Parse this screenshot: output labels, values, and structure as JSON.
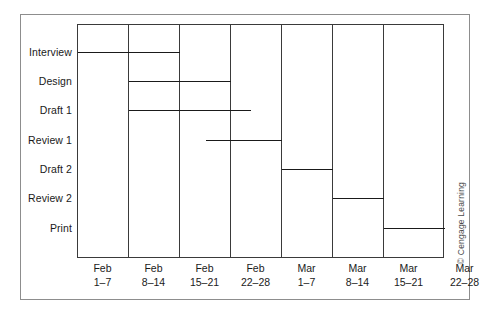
{
  "chart_data": {
    "type": "bar",
    "title": "",
    "subtitle": "",
    "xlabel": "",
    "ylabel": "",
    "orientation": "horizontal-gantt",
    "grid": true,
    "legend": null,
    "x_unit": "week",
    "x_ticks": [
      {
        "month": "Feb",
        "days": "1–7"
      },
      {
        "month": "Feb",
        "days": "8–14"
      },
      {
        "month": "Feb",
        "days": "15–21"
      },
      {
        "month": "Feb",
        "days": "22–28"
      },
      {
        "month": "Mar",
        "days": "1–7"
      },
      {
        "month": "Mar",
        "days": "8–14"
      },
      {
        "month": "Mar",
        "days": "15–21"
      },
      {
        "month": "Mar",
        "days": "22–28"
      }
    ],
    "categories": [
      "Interview",
      "Design",
      "Draft 1",
      "Review 1",
      "Draft 2",
      "Review 2",
      "Print"
    ],
    "xlim": [
      0,
      8
    ],
    "tasks": [
      {
        "name": "Interview",
        "start_week": 0.0,
        "end_week": 2.0,
        "start_label": "Feb 1–7",
        "end_label": "Feb 15–21"
      },
      {
        "name": "Design",
        "start_week": 1.0,
        "end_week": 3.0,
        "start_label": "Feb 8–14",
        "end_label": "Feb 22–28"
      },
      {
        "name": "Draft 1",
        "start_week": 1.0,
        "end_week": 3.4,
        "start_label": "Feb 8–14",
        "end_label": "Feb 22–28"
      },
      {
        "name": "Review 1",
        "start_week": 2.5,
        "end_week": 4.0,
        "start_label": "Feb 15–21",
        "end_label": "Mar 1–7"
      },
      {
        "name": "Draft 2",
        "start_week": 4.0,
        "end_week": 5.0,
        "start_label": "Mar 1–7",
        "end_label": "Mar 8–14"
      },
      {
        "name": "Review 2",
        "start_week": 5.0,
        "end_week": 6.0,
        "start_label": "Mar 8–14",
        "end_label": "Mar 15–21"
      },
      {
        "name": "Print",
        "start_week": 6.0,
        "end_week": 7.2,
        "start_label": "Mar 15–21",
        "end_label": "Mar 22–28"
      }
    ],
    "colors": {
      "bar": "#1a1a1a",
      "grid": "#3a3a3a",
      "frame": "#8d8d8d",
      "text": "#1a1a1a",
      "background": "#ffffff"
    }
  },
  "credit": {
    "text": "© Cengage Learning"
  }
}
